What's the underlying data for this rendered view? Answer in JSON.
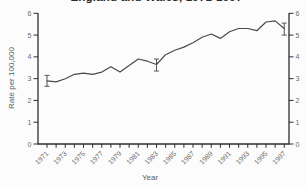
{
  "title": "England and Wales, 1971-1997",
  "axes": {
    "y_left_label": "Rate per 100,000",
    "x_label": "Year",
    "y_tick_labels": [
      "0",
      "1",
      "2",
      "3",
      "4",
      "5",
      "6"
    ],
    "x_tick_labels": [
      "1971",
      "1973",
      "1975",
      "1977",
      "1979",
      "1981",
      "1983",
      "1985",
      "1987",
      "1989",
      "1991",
      "1993",
      "1995",
      "1997"
    ]
  },
  "colors": {
    "line": "#4a4a4a",
    "axis": "#2e2e2e",
    "tick_text": "#6b6b6b",
    "background": "#fcfcfc"
  },
  "chart_data": {
    "type": "line",
    "title": "England and Wales, 1971-1997",
    "xlabel": "Year",
    "ylabel": "Rate per 100,000",
    "x": [
      1971,
      1972,
      1973,
      1974,
      1975,
      1976,
      1977,
      1978,
      1979,
      1980,
      1981,
      1982,
      1983,
      1984,
      1985,
      1986,
      1987,
      1988,
      1989,
      1990,
      1991,
      1992,
      1993,
      1994,
      1995,
      1996,
      1997
    ],
    "values": [
      2.9,
      2.85,
      3.0,
      3.2,
      3.25,
      3.2,
      3.3,
      3.55,
      3.3,
      3.6,
      3.9,
      3.8,
      3.65,
      4.1,
      4.3,
      4.45,
      4.65,
      4.9,
      5.05,
      4.85,
      5.15,
      5.3,
      5.3,
      5.2,
      5.6,
      5.65,
      5.3
    ],
    "error_bars": [
      {
        "x": 1971,
        "low": 2.65,
        "high": 3.15
      },
      {
        "x": 1983,
        "low": 3.35,
        "high": 3.9
      },
      {
        "x": 1997,
        "low": 5.0,
        "high": 5.55
      }
    ],
    "ylim": [
      0,
      6
    ],
    "y_ticks": [
      0,
      1,
      2,
      3,
      4,
      5,
      6
    ],
    "x_labeled_every": 2,
    "grid": false,
    "legend": "none",
    "line_color": "#4a4a4a"
  }
}
